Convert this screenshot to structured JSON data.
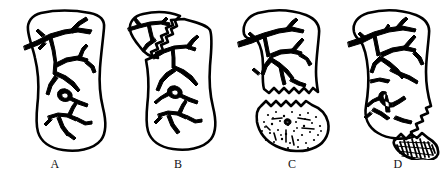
{
  "figure": {
    "kind": "line-art-illustration",
    "background_color": "#ffffff",
    "ink_color": "#000000",
    "caption_font_style": "serif",
    "panel_count": 4,
    "panels": [
      {
        "label": "A",
        "label_x": 67,
        "label_y": 163,
        "shape": "stocking",
        "description": "intact stocking-shaped outline filled with a branching vascular tree",
        "state": "intact",
        "tear_line": "none",
        "detached_piece": "none",
        "texture": "none"
      },
      {
        "label": "B",
        "label_x": 178,
        "label_y": 163,
        "shape": "stocking",
        "description": "stocking with a jagged zigzag tear separating the upper-left cuff flap, still attached",
        "state": "partially-torn",
        "tear_line": "zigzag-diagonal-upper-left",
        "detached_piece": "cuff-flap-attached",
        "texture": "none"
      },
      {
        "label": "C",
        "label_x": 292,
        "label_y": 163,
        "shape": "stocking",
        "description": "upper leg portion separated from the stippled foot portion along matching jagged edges",
        "state": "separated",
        "tear_line": "zigzag-horizontal-lower",
        "detached_piece": "foot-stippled",
        "texture": "stipple-dots"
      },
      {
        "label": "D",
        "label_x": 398,
        "label_y": 163,
        "shape": "stocking",
        "description": "main body with jagged lower-right edge and a small detached hatched wedge fragment",
        "state": "fragmented",
        "tear_line": "zigzag-diagonal-lower-right",
        "detached_piece": "wedge-hatched",
        "texture": "dense-hatching"
      }
    ]
  }
}
